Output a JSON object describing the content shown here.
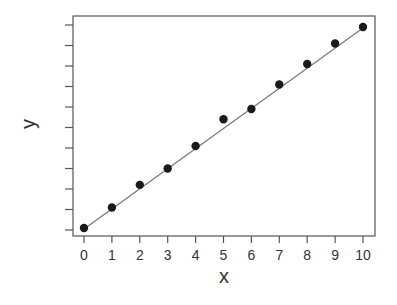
{
  "chart_data": {
    "type": "scatter",
    "title": "",
    "xlabel": "x",
    "ylabel": "y",
    "x": [
      0,
      1,
      2,
      3,
      4,
      5,
      6,
      7,
      8,
      9,
      10
    ],
    "series": [
      {
        "name": "observations",
        "kind": "points",
        "values": [
          0.1,
          1.1,
          2.2,
          3.0,
          4.1,
          5.4,
          5.9,
          7.1,
          8.1,
          9.1,
          9.9
        ]
      },
      {
        "name": "fit line",
        "kind": "line",
        "x": [
          0,
          10
        ],
        "values": [
          0.05,
          9.85
        ]
      }
    ],
    "xticks": [
      "0",
      "1",
      "2",
      "3",
      "4",
      "5",
      "6",
      "7",
      "8",
      "9",
      "10"
    ],
    "yticks_count": 11,
    "ytick_labels_visible": false,
    "xlim": [
      -0.4,
      10.4
    ],
    "ylim": [
      -0.3,
      10.4
    ],
    "grid": false,
    "legend": null,
    "colors": {
      "points": "#1a1a1a",
      "line": "#777777",
      "frame": "#555555",
      "text": "#333333"
    }
  }
}
